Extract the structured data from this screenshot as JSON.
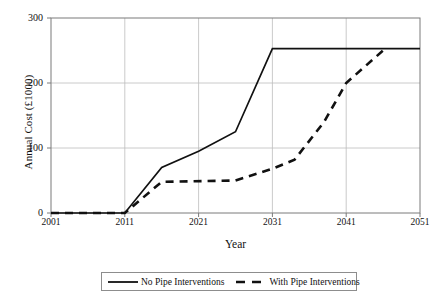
{
  "chart_data": {
    "type": "line",
    "title": "",
    "xlabel": "Year",
    "ylabel": "Annual Cost (£1000)",
    "xlim": [
      2001,
      2051
    ],
    "ylim": [
      0,
      300
    ],
    "xticks": [
      2001,
      2011,
      2021,
      2031,
      2041,
      2051
    ],
    "yticks": [
      0,
      100,
      200,
      300
    ],
    "xtick_labels": [
      "2001",
      "2011",
      "2021",
      "2031",
      "2041",
      "2051"
    ],
    "ytick_labels": [
      "0",
      "100",
      "200",
      "300"
    ],
    "grid": "horizontal-and-vertical-light",
    "legend_position": "below-plot",
    "series": [
      {
        "name": "No Pipe Interventions",
        "style": "solid",
        "color": "#111111",
        "x": [
          2001,
          2011,
          2016,
          2021,
          2026,
          2031,
          2051
        ],
        "values": [
          0,
          0,
          70,
          95,
          125,
          253,
          253
        ]
      },
      {
        "name": "With Pipe Interventions",
        "style": "dashed",
        "color": "#111111",
        "x": [
          2001,
          2011,
          2016,
          2026,
          2031,
          2034,
          2038,
          2041,
          2046
        ],
        "values": [
          0,
          0,
          48,
          50,
          68,
          82,
          140,
          200,
          250
        ]
      }
    ]
  },
  "legend": {
    "entries": [
      {
        "label": "No Pipe Interventions",
        "style": "solid"
      },
      {
        "label": "With Pipe Interventions",
        "style": "dashed"
      }
    ]
  },
  "axis": {
    "y_title": "Annual Cost (£1000)",
    "x_title": "Year"
  },
  "colors": {
    "line": "#111111",
    "grid": "#bdbdbd",
    "frame": "#7a7a7a",
    "background": "#ffffff"
  }
}
